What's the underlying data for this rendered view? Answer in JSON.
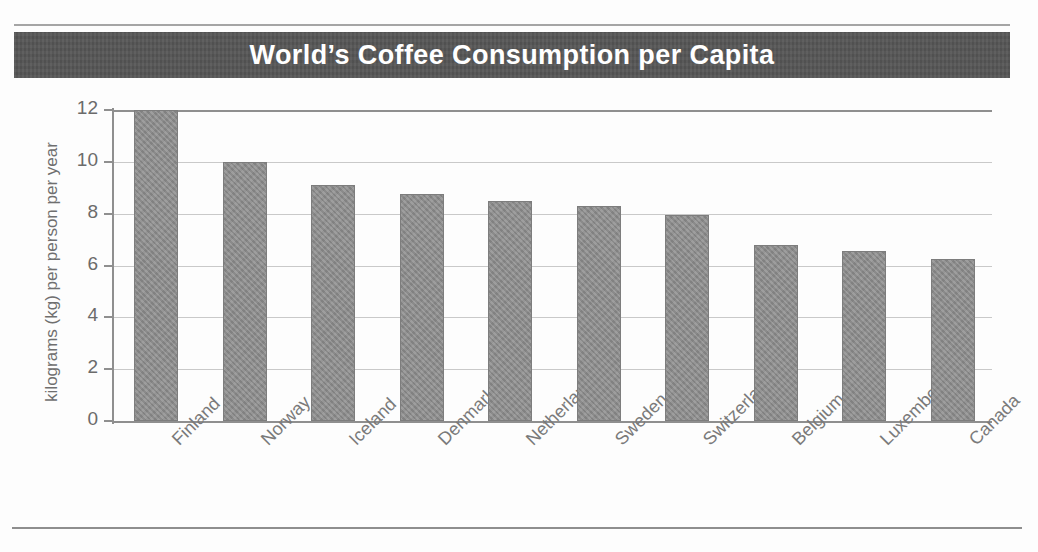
{
  "figure": {
    "has_top_rule": true,
    "has_bottom_rule": true,
    "banner_color": "#565656",
    "bar_color": "#8c8c8c",
    "grid_color": "#c9c9c9",
    "axis_color": "#8f8f8f",
    "text_color": "#6f6f6f",
    "title_text_color": "#ffffff"
  },
  "chart_data": {
    "type": "bar",
    "title": "World’s Coffee Consumption per Capita",
    "xlabel": "",
    "ylabel": "kilograms (kg) per person per year",
    "categories": [
      "Finland",
      "Norway",
      "Iceland",
      "Denmark",
      "Netherlands",
      "Sweden",
      "Switzerland",
      "Belgium",
      "Luxembourg",
      "Canada"
    ],
    "values": [
      12.0,
      10.0,
      9.1,
      8.75,
      8.5,
      8.3,
      7.95,
      6.8,
      6.55,
      6.25
    ],
    "ylim": [
      0,
      12
    ],
    "yticks": [
      0,
      2,
      4,
      6,
      8,
      10,
      12
    ],
    "ytick_labels": [
      "0",
      "2",
      "4",
      "6",
      "8",
      "10",
      "12"
    ],
    "grid": true,
    "grid_axis": "y",
    "legend": false,
    "legend_position": "none",
    "bar_orientation": "vertical",
    "tick_label_rotation": -45
  }
}
